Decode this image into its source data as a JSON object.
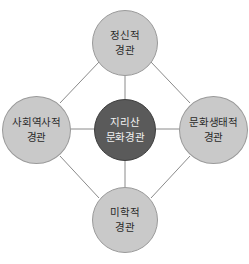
{
  "diagram": {
    "colors": {
      "outer_fill": "#c9c9c9",
      "outer_border": "#9a9a9a",
      "core_fill": "#5a5a5a",
      "core_text": "#f2f2f2",
      "line": "#8a8a8a"
    },
    "center": {
      "line1": "지리산",
      "line2": "문화경관"
    },
    "nodes": {
      "top": {
        "line1": "정신적",
        "line2": "경관"
      },
      "left": {
        "line1": "사회역사적",
        "line2": "경관"
      },
      "right": {
        "line1": "문화생태적",
        "line2": "경관"
      },
      "bottom": {
        "line1": "미학적",
        "line2": "경관"
      }
    }
  }
}
